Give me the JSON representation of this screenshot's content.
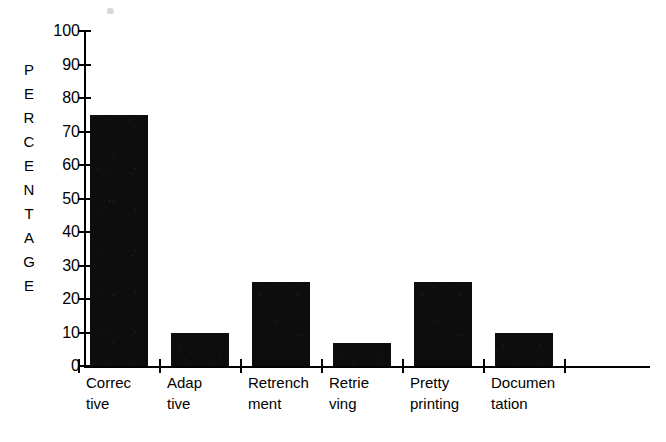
{
  "chart_data": {
    "type": "bar",
    "title": "",
    "xlabel": "",
    "ylabel": "PERCENTAGE",
    "ylim": [
      0,
      100
    ],
    "ytick_step": 10,
    "grid": false,
    "legend": null,
    "bar_color": "#0d0d0d",
    "background_color": "#ffffff",
    "axis_color": "#000000",
    "categories": [
      "Corrective",
      "Adaptive",
      "Retrenchment",
      "Retrieving",
      "Pretty printing",
      "Documentation"
    ],
    "category_label_lines": [
      [
        "Correc",
        "tive"
      ],
      [
        "Adap",
        "tive"
      ],
      [
        "Retrench",
        "ment"
      ],
      [
        "Retrie",
        "ving"
      ],
      [
        "Pretty",
        "printing"
      ],
      [
        "Documen",
        "tation"
      ]
    ],
    "values": [
      75,
      10,
      25,
      7,
      25,
      10
    ],
    "ytick_labels": [
      "100",
      "90",
      "80",
      "70",
      "60",
      "50",
      "40",
      "30",
      "20",
      "10",
      "0"
    ],
    "ytick_values": [
      100,
      90,
      80,
      70,
      60,
      50,
      40,
      30,
      20,
      10,
      0
    ],
    "ylabel_letters": [
      "P",
      "E",
      "R",
      "C",
      "E",
      "N",
      "T",
      "A",
      "G",
      "E"
    ]
  }
}
